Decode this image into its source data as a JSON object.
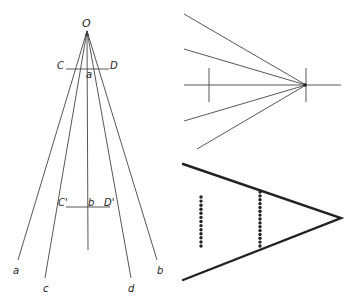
{
  "panels": {
    "left": {
      "description": "Rays fanning from apex O with two horizontal cross-segments",
      "apex_label": "O",
      "upper_segment": {
        "left_label": "C",
        "right_label": "D",
        "mid_label": "a"
      },
      "lower_segment": {
        "left_label": "C'",
        "right_label": "D'",
        "mid_label": "b"
      },
      "ray_labels": [
        "a",
        "c",
        "d",
        "b"
      ]
    },
    "top_right": {
      "description": "Four rays converging on a point with horizontal axis and two vertical ticks"
    },
    "bottom_right": {
      "description": "V-shape (angle) pointing right with two dotted vertical lines",
      "dotted_lines": [
        {
          "position": "outer",
          "dot_count": 13
        },
        {
          "position": "inner",
          "dot_count": 15
        }
      ]
    }
  }
}
